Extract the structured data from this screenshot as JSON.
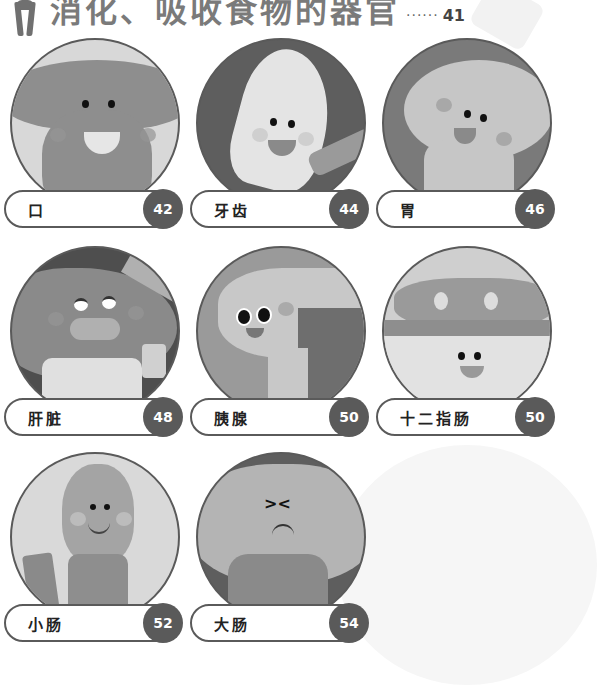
{
  "header": {
    "title": "消化、吸收食物的器官",
    "leader_dots": "······",
    "page": "41"
  },
  "colors": {
    "border": "#5a5a5a",
    "badge_bg": "#5a5a5a",
    "badge_text": "#ffffff",
    "title_text": "#7a7a7a"
  },
  "organs": [
    {
      "label": "口",
      "page": "42",
      "illustration": "mouth-character",
      "bg": "#d8d8d8",
      "fg": "#8e8e8e"
    },
    {
      "label": "牙齿",
      "page": "44",
      "illustration": "tooth-character",
      "bg": "#5e5e5e",
      "fg": "#e4e4e4"
    },
    {
      "label": "胃",
      "page": "46",
      "illustration": "stomach-character",
      "bg": "#7a7a7a",
      "fg": "#c6c6c6"
    },
    {
      "label": "肝脏",
      "page": "48",
      "illustration": "liver-character",
      "bg": "#4e4e4e",
      "fg": "#8a8a8a"
    },
    {
      "label": "胰腺",
      "page": "50",
      "illustration": "pancreas-character",
      "bg": "#9a9a9a",
      "fg": "#c8c8c8"
    },
    {
      "label": "十二指肠",
      "page": "50",
      "illustration": "duodenum-character",
      "bg": "#cfcfcf",
      "fg": "#9a9a9a"
    },
    {
      "label": "小肠",
      "page": "52",
      "illustration": "small-intestine-character",
      "bg": "#d9d9d9",
      "fg": "#a4a4a4"
    },
    {
      "label": "大肠",
      "page": "54",
      "illustration": "large-intestine-character",
      "bg": "#5e5e5e",
      "fg": "#b4b4b4"
    }
  ]
}
